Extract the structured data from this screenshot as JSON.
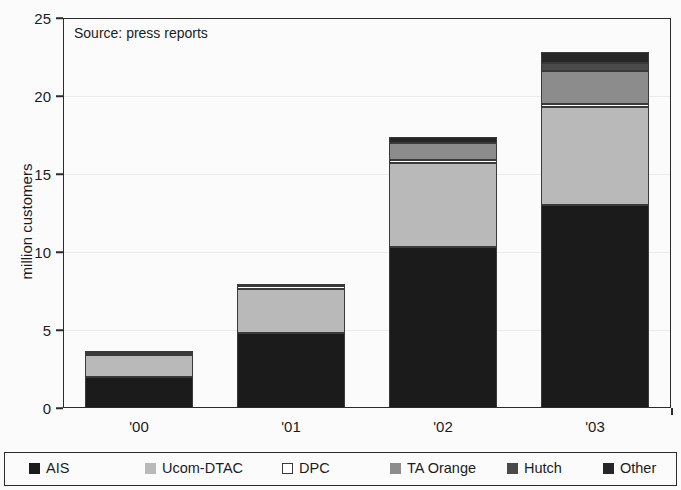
{
  "source_note": "Source: press reports",
  "axes": {
    "y_title": "million customers",
    "y_ticks": [
      "0",
      "5",
      "10",
      "15",
      "20",
      "25"
    ],
    "x_ticks": [
      "'00",
      "'01",
      "'02",
      "'03"
    ]
  },
  "legend": {
    "items": [
      {
        "label": "AIS",
        "color": "#1b1b1b",
        "fill_class": "f-ais"
      },
      {
        "label": "Ucom-DTAC",
        "color": "#b9b9b9",
        "fill_class": "f-ucom"
      },
      {
        "label": "DPC",
        "color": "#ffffff",
        "fill_class": "f-dpc"
      },
      {
        "label": "TA Orange",
        "color": "#8c8c8c",
        "fill_class": "f-taorange"
      },
      {
        "label": "Hutch",
        "color": "#4a4a4a",
        "fill_class": "f-hutch"
      },
      {
        "label": "Other",
        "color": "#262626",
        "fill_class": "f-other"
      }
    ]
  },
  "chart_data": {
    "type": "bar",
    "stacked": true,
    "title": "",
    "subtitle": "",
    "xlabel": "",
    "ylabel": "million customers",
    "ylim": [
      0,
      25
    ],
    "ytick_step": 5,
    "grid": true,
    "legend_position": "bottom",
    "annotations": [
      "Source: press reports"
    ],
    "categories": [
      "'00",
      "'01",
      "'02",
      "'03"
    ],
    "series": [
      {
        "name": "AIS",
        "values": [
          2.0,
          4.8,
          10.3,
          13.0
        ]
      },
      {
        "name": "Ucom-DTAC",
        "values": [
          1.4,
          2.8,
          5.4,
          6.3
        ]
      },
      {
        "name": "DPC",
        "values": [
          0.15,
          0.2,
          0.2,
          0.2
        ]
      },
      {
        "name": "TA Orange",
        "values": [
          0.0,
          0.0,
          1.1,
          2.1
        ]
      },
      {
        "name": "Hutch",
        "values": [
          0.0,
          0.0,
          0.0,
          0.5
        ]
      },
      {
        "name": "Other",
        "values": [
          0.05,
          0.1,
          0.4,
          0.7
        ]
      }
    ],
    "totals": [
      3.6,
      7.9,
      17.4,
      22.8
    ]
  }
}
